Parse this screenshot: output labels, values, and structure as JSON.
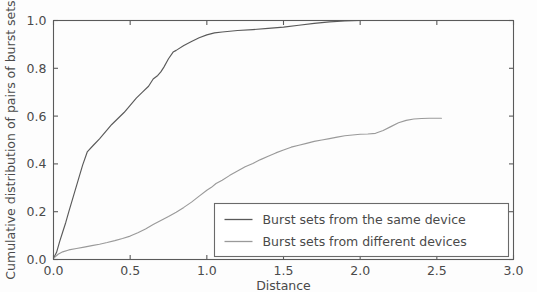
{
  "chart_data": {
    "type": "line",
    "title": "",
    "xlabel": "Distance",
    "ylabel": "Cumulative distribution of pairs of burst sets",
    "xlim": [
      0.0,
      3.0
    ],
    "ylim": [
      0.0,
      1.0
    ],
    "xticks": [
      "0.0",
      "0.5",
      "1.0",
      "1.5",
      "2.0",
      "2.5",
      "3.0"
    ],
    "xtick_values": [
      0.0,
      0.5,
      1.0,
      1.5,
      2.0,
      2.5,
      3.0
    ],
    "yticks": [
      "0.0",
      "0.2",
      "0.4",
      "0.6",
      "0.8",
      "1.0"
    ],
    "ytick_values": [
      0.0,
      0.2,
      0.4,
      0.6,
      0.8,
      1.0
    ],
    "grid": false,
    "legend_position": "lower right",
    "series": [
      {
        "name": "Burst sets from the same device",
        "color": "#5a5a5a",
        "x": [
          0.0,
          0.02,
          0.04,
          0.06,
          0.08,
          0.1,
          0.13,
          0.16,
          0.19,
          0.22,
          0.26,
          0.3,
          0.34,
          0.38,
          0.42,
          0.46,
          0.5,
          0.54,
          0.58,
          0.62,
          0.65,
          0.68,
          0.7,
          0.72,
          0.75,
          0.78,
          0.8,
          0.85,
          0.9,
          0.95,
          1.0,
          1.05,
          1.1,
          1.2,
          1.3,
          1.4,
          1.5,
          1.6,
          1.7,
          1.8,
          1.9,
          2.0,
          2.1,
          2.2,
          2.3,
          2.4,
          2.53
        ],
        "y": [
          0.005,
          0.03,
          0.075,
          0.115,
          0.155,
          0.2,
          0.265,
          0.33,
          0.395,
          0.45,
          0.478,
          0.505,
          0.535,
          0.565,
          0.59,
          0.615,
          0.645,
          0.675,
          0.7,
          0.725,
          0.755,
          0.77,
          0.785,
          0.805,
          0.84,
          0.868,
          0.875,
          0.895,
          0.912,
          0.928,
          0.94,
          0.948,
          0.952,
          0.958,
          0.962,
          0.967,
          0.972,
          0.98,
          0.988,
          0.994,
          0.998,
          1.0,
          1.0,
          1.0,
          1.0,
          1.0,
          1.0
        ]
      },
      {
        "name": "Burst sets from different devices",
        "color": "#9a9a9a",
        "x": [
          0.0,
          0.03,
          0.06,
          0.1,
          0.15,
          0.2,
          0.25,
          0.3,
          0.35,
          0.4,
          0.45,
          0.5,
          0.55,
          0.6,
          0.65,
          0.7,
          0.75,
          0.8,
          0.85,
          0.9,
          0.95,
          1.0,
          1.03,
          1.06,
          1.1,
          1.15,
          1.2,
          1.25,
          1.3,
          1.35,
          1.4,
          1.45,
          1.5,
          1.55,
          1.6,
          1.65,
          1.7,
          1.75,
          1.8,
          1.85,
          1.9,
          1.95,
          2.0,
          2.05,
          2.1,
          2.15,
          2.2,
          2.25,
          2.3,
          2.35,
          2.4,
          2.45,
          2.53
        ],
        "y": [
          0.005,
          0.022,
          0.032,
          0.04,
          0.046,
          0.052,
          0.058,
          0.064,
          0.071,
          0.079,
          0.088,
          0.098,
          0.112,
          0.128,
          0.146,
          0.163,
          0.18,
          0.198,
          0.218,
          0.24,
          0.265,
          0.29,
          0.302,
          0.318,
          0.332,
          0.352,
          0.37,
          0.388,
          0.402,
          0.418,
          0.432,
          0.446,
          0.458,
          0.47,
          0.478,
          0.486,
          0.494,
          0.5,
          0.506,
          0.512,
          0.518,
          0.521,
          0.524,
          0.525,
          0.528,
          0.54,
          0.556,
          0.572,
          0.582,
          0.588,
          0.59,
          0.591,
          0.591
        ]
      }
    ],
    "legend_entries": [
      "Burst sets from the same device",
      "Burst sets from different devices"
    ]
  },
  "figure": {
    "background_color": "#fdfdfd",
    "axis_color": "#5a5a5a"
  }
}
